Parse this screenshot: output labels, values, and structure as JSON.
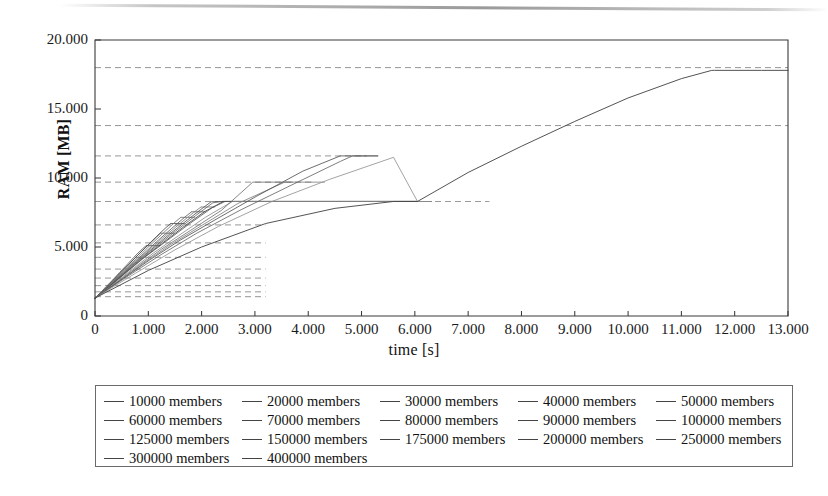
{
  "chart_data": {
    "type": "line",
    "title": "",
    "xlabel": "time [s]",
    "ylabel": "RAM [MB]",
    "xlim": [
      0,
      13000
    ],
    "ylim": [
      0,
      20000
    ],
    "xticks": [
      "0",
      "1.000",
      "2.000",
      "3.000",
      "4.000",
      "5.000",
      "6.000",
      "7.000",
      "8.000",
      "9.000",
      "10.000",
      "11.000",
      "12.000",
      "13.000"
    ],
    "xtick_values": [
      0,
      1000,
      2000,
      3000,
      4000,
      5000,
      6000,
      7000,
      8000,
      9000,
      10000,
      11000,
      12000,
      13000
    ],
    "yticks": [
      "0",
      "5.000",
      "10.000",
      "15.000",
      "20.000"
    ],
    "ytick_values": [
      0,
      5000,
      10000,
      15000,
      20000
    ],
    "grid": false,
    "dashed_reference_levels": [
      1400,
      1750,
      2200,
      2750,
      3400,
      4250,
      5300,
      6600,
      8300,
      9700,
      11600,
      13800,
      18000
    ],
    "legend_position": "below-plot",
    "series": [
      {
        "name": "10000 members",
        "color": "#555555",
        "points": [
          [
            0,
            1300
          ],
          [
            120,
            1750
          ],
          [
            200,
            2100
          ],
          [
            330,
            2600
          ],
          [
            460,
            3150
          ],
          [
            620,
            3800
          ],
          [
            790,
            4500
          ],
          [
            900,
            4900
          ],
          [
            960,
            5100
          ]
        ]
      },
      {
        "name": "20000 members",
        "color": "#666666",
        "points": [
          [
            0,
            1300
          ],
          [
            150,
            1800
          ],
          [
            280,
            2350
          ],
          [
            430,
            2950
          ],
          [
            600,
            3600
          ],
          [
            800,
            4400
          ],
          [
            1000,
            5150
          ],
          [
            1150,
            5700
          ],
          [
            1230,
            6000
          ]
        ]
      },
      {
        "name": "30000 members",
        "color": "#4a4a4a",
        "points": [
          [
            0,
            1300
          ],
          [
            170,
            1900
          ],
          [
            320,
            2500
          ],
          [
            500,
            3200
          ],
          [
            700,
            4000
          ],
          [
            930,
            4900
          ],
          [
            1150,
            5750
          ],
          [
            1330,
            6400
          ],
          [
            1420,
            6700
          ]
        ]
      },
      {
        "name": "40000 members",
        "color": "#707070",
        "points": [
          [
            0,
            1300
          ],
          [
            190,
            1950
          ],
          [
            360,
            2600
          ],
          [
            560,
            3350
          ],
          [
            790,
            4200
          ],
          [
            1040,
            5150
          ],
          [
            1290,
            6050
          ],
          [
            1500,
            6800
          ],
          [
            1610,
            7150
          ]
        ]
      },
      {
        "name": "50000 members",
        "color": "#5a5a5a",
        "points": [
          [
            0,
            1300
          ],
          [
            210,
            2000
          ],
          [
            400,
            2700
          ],
          [
            620,
            3500
          ],
          [
            880,
            4400
          ],
          [
            1160,
            5400
          ],
          [
            1440,
            6350
          ],
          [
            1680,
            7150
          ],
          [
            1810,
            7550
          ]
        ]
      },
      {
        "name": "60000 members",
        "color": "#7a7a7a",
        "points": [
          [
            0,
            1300
          ],
          [
            230,
            2050
          ],
          [
            440,
            2800
          ],
          [
            680,
            3650
          ],
          [
            960,
            4600
          ],
          [
            1270,
            5650
          ],
          [
            1580,
            6650
          ],
          [
            1850,
            7500
          ],
          [
            1990,
            7900
          ]
        ]
      },
      {
        "name": "70000 members",
        "color": "#505050",
        "points": [
          [
            0,
            1300
          ],
          [
            250,
            2100
          ],
          [
            480,
            2900
          ],
          [
            740,
            3800
          ],
          [
            1050,
            4800
          ],
          [
            1390,
            5900
          ],
          [
            1730,
            6950
          ],
          [
            2030,
            7850
          ],
          [
            2180,
            8280
          ],
          [
            2400,
            8300
          ],
          [
            3000,
            8300
          ],
          [
            4000,
            8300
          ],
          [
            5000,
            8300
          ],
          [
            6050,
            8300
          ]
        ]
      },
      {
        "name": "80000 members",
        "color": "#666666",
        "points": [
          [
            0,
            1300
          ],
          [
            270,
            2150
          ],
          [
            520,
            3000
          ],
          [
            800,
            3950
          ],
          [
            1140,
            5000
          ],
          [
            1510,
            6150
          ],
          [
            1880,
            7250
          ],
          [
            2210,
            8200
          ],
          [
            2380,
            8300
          ],
          [
            2500,
            8300
          ],
          [
            3500,
            8300
          ],
          [
            4500,
            8300
          ],
          [
            5500,
            8300
          ],
          [
            6050,
            8300
          ]
        ]
      },
      {
        "name": "90000 members",
        "color": "#3d3d3d",
        "points": [
          [
            0,
            1300
          ],
          [
            290,
            2200
          ],
          [
            560,
            3100
          ],
          [
            870,
            4100
          ],
          [
            1240,
            5200
          ],
          [
            1640,
            6400
          ],
          [
            2050,
            7550
          ],
          [
            2410,
            8300
          ],
          [
            2460,
            8300
          ],
          [
            3000,
            8300
          ],
          [
            4000,
            8300
          ],
          [
            5200,
            8300
          ],
          [
            6050,
            8300
          ]
        ]
      },
      {
        "name": "100000 members",
        "color": "#585858",
        "points": [
          [
            0,
            1300
          ],
          [
            310,
            2250
          ],
          [
            600,
            3200
          ],
          [
            930,
            4250
          ],
          [
            1330,
            5400
          ],
          [
            1760,
            6650
          ],
          [
            2200,
            7850
          ],
          [
            2440,
            8300
          ],
          [
            2600,
            8300
          ],
          [
            3600,
            8300
          ],
          [
            4800,
            8300
          ],
          [
            6050,
            8300
          ]
        ]
      },
      {
        "name": "125000 members",
        "color": "#8a8a8a",
        "points": [
          [
            0,
            1300
          ],
          [
            360,
            2350
          ],
          [
            700,
            3400
          ],
          [
            1090,
            4550
          ],
          [
            1560,
            5800
          ],
          [
            2070,
            7150
          ],
          [
            2580,
            8300
          ],
          [
            2700,
            8300
          ],
          [
            3400,
            8300
          ],
          [
            4600,
            8300
          ],
          [
            5400,
            8300
          ],
          [
            6050,
            8300
          ]
        ]
      },
      {
        "name": "150000 members",
        "color": "#6e6e6e",
        "points": [
          [
            0,
            1300
          ],
          [
            410,
            2450
          ],
          [
            800,
            3600
          ],
          [
            1250,
            4850
          ],
          [
            1790,
            6200
          ],
          [
            2370,
            7650
          ],
          [
            2960,
            9700
          ],
          [
            3100,
            9700
          ],
          [
            3450,
            9700
          ]
        ]
      },
      {
        "name": "175000 members",
        "color": "#7d7d7d",
        "points": [
          [
            0,
            1300
          ],
          [
            460,
            2550
          ],
          [
            900,
            3800
          ],
          [
            1410,
            5150
          ],
          [
            2020,
            6600
          ],
          [
            2680,
            8150
          ],
          [
            3560,
            9700
          ],
          [
            3700,
            9700
          ],
          [
            4050,
            9700
          ]
        ]
      },
      {
        "name": "200000 members",
        "color": "#4f4f4f",
        "points": [
          [
            0,
            1300
          ],
          [
            520,
            2700
          ],
          [
            1020,
            4050
          ],
          [
            1600,
            5500
          ],
          [
            2290,
            7050
          ],
          [
            3040,
            8700
          ],
          [
            3900,
            10500
          ],
          [
            4600,
            11600
          ],
          [
            4750,
            11600
          ],
          [
            5050,
            11600
          ]
        ]
      },
      {
        "name": "250000 members",
        "color": "#636363",
        "points": [
          [
            0,
            1300
          ],
          [
            620,
            2900
          ],
          [
            1220,
            4400
          ],
          [
            1910,
            6000
          ],
          [
            2740,
            7700
          ],
          [
            3640,
            9400
          ],
          [
            4600,
            11200
          ],
          [
            4830,
            11600
          ],
          [
            4900,
            11600
          ],
          [
            5050,
            11600
          ]
        ]
      },
      {
        "name": "300000 members",
        "color": "#909090",
        "points": [
          [
            0,
            1300
          ],
          [
            760,
            3100
          ],
          [
            1480,
            4750
          ],
          [
            2320,
            6500
          ],
          [
            3320,
            8300
          ],
          [
            4400,
            9900
          ],
          [
            5600,
            11500
          ],
          [
            6050,
            8300
          ]
        ]
      },
      {
        "name": "400000 members",
        "color": "#444444",
        "points": [
          [
            0,
            1300
          ],
          [
            1000,
            3300
          ],
          [
            2000,
            5000
          ],
          [
            3200,
            6700
          ],
          [
            4500,
            7800
          ],
          [
            5600,
            8300
          ],
          [
            6050,
            8300
          ],
          [
            7000,
            10400
          ],
          [
            8000,
            12300
          ],
          [
            9000,
            14100
          ],
          [
            10000,
            15800
          ],
          [
            11000,
            17200
          ],
          [
            11570,
            17800
          ],
          [
            11620,
            17800
          ],
          [
            12500,
            17800
          ],
          [
            13000,
            17800
          ]
        ]
      }
    ]
  },
  "axes": {
    "y_title": "RAM [MB]",
    "x_title": "time [s]"
  },
  "legend": {
    "rows": [
      [
        {
          "label": "10000 members"
        },
        {
          "label": "20000 members"
        },
        {
          "label": "30000 members"
        },
        {
          "label": "40000 members"
        },
        {
          "label": "50000 members"
        }
      ],
      [
        {
          "label": "60000 members"
        },
        {
          "label": "70000 members"
        },
        {
          "label": "80000 members"
        },
        {
          "label": "90000 members"
        },
        {
          "label": "100000 members"
        }
      ],
      [
        {
          "label": "125000 members"
        },
        {
          "label": "150000 members"
        },
        {
          "label": "175000 members"
        },
        {
          "label": "200000 members"
        },
        {
          "label": "250000 members"
        }
      ],
      [
        {
          "label": "300000 members"
        },
        {
          "label": "400000 members"
        }
      ]
    ]
  },
  "colors": {
    "axis": "#333333",
    "plot_line": "#555555",
    "dashed_level": "#777777",
    "legend_border": "#6b6b6b",
    "background": "#ffffff"
  }
}
